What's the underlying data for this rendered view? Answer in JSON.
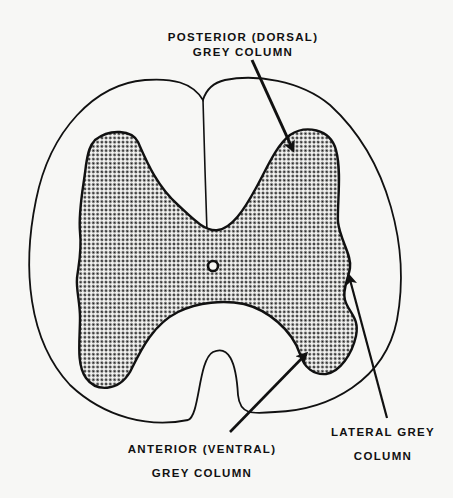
{
  "diagram": {
    "colors": {
      "background": "#f7f7f5",
      "outline": "#111111",
      "grey_matter_dots": "#1a1a1a",
      "grey_matter_fill": "#f2f2f0"
    },
    "labels": {
      "posterior": {
        "line1": "POSTERIOR (DORSAL)",
        "line2": "GREY COLUMN"
      },
      "lateral": {
        "line1": "LATERAL GREY",
        "line2": "COLUMN"
      },
      "anterior": {
        "line1": "ANTERIOR (VENTRAL)",
        "line2": "GREY COLUMN"
      }
    },
    "structures": [
      "outer-white-matter-outline",
      "posterior-median-sulcus",
      "anterior-median-fissure",
      "grey-matter-butterfly",
      "central-canal"
    ]
  }
}
